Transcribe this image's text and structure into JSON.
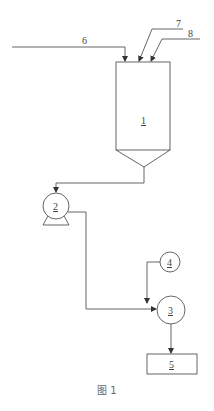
{
  "figure": {
    "caption": "图 1",
    "stroke_color": "#555555",
    "background": "#ffffff"
  },
  "components": {
    "tank": {
      "label": "1",
      "type": "hopper-tank"
    },
    "pump": {
      "label": "2",
      "type": "pump"
    },
    "mixer": {
      "label": "3",
      "type": "circle-unit"
    },
    "feeder": {
      "label": "4",
      "type": "circle-unit"
    },
    "receiver": {
      "label": "5",
      "type": "box"
    }
  },
  "streams": {
    "s6": {
      "label": "6"
    },
    "s7": {
      "label": "7"
    },
    "s8": {
      "label": "8"
    }
  }
}
